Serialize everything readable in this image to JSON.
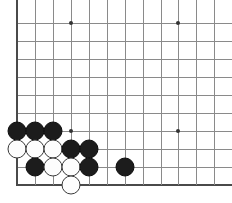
{
  "board": {
    "title": "Go board corner diagram",
    "description": "Bottom-left corner of a Go board showing a joseki-style stone formation",
    "line_color": "#8a8a8a",
    "edge_color": "#4a4a4a",
    "background_color": "#ffffff",
    "black_stone_color": "#1c1c1c",
    "white_stone_color": "#fdfdfd",
    "stone_diameter": 19,
    "grid_spacing": 17.9,
    "vertical_lines_x": [
      17,
      35,
      53,
      71,
      89,
      107,
      125,
      143,
      161,
      178,
      196,
      214
    ],
    "horizontal_lines_y": [
      23,
      41,
      59,
      77,
      95,
      113,
      131,
      149,
      167,
      185
    ],
    "edges": {
      "left_x": 17,
      "bottom_y": 185
    },
    "star_points": [
      {
        "name": "hoshi-top-left",
        "x": 71,
        "y": 23
      },
      {
        "name": "hoshi-top-right",
        "x": 178,
        "y": 23
      },
      {
        "name": "hoshi-bottom-left",
        "x": 71,
        "y": 131
      },
      {
        "name": "hoshi-bottom-right",
        "x": 178,
        "y": 131
      }
    ],
    "stones": [
      {
        "color": "black",
        "x": 17,
        "y": 131,
        "label": "black-stone-a1"
      },
      {
        "color": "black",
        "x": 35,
        "y": 131,
        "label": "black-stone-a2"
      },
      {
        "color": "black",
        "x": 53,
        "y": 131,
        "label": "black-stone-a3"
      },
      {
        "color": "white",
        "x": 17,
        "y": 149,
        "label": "white-stone-b1"
      },
      {
        "color": "white",
        "x": 35,
        "y": 149,
        "label": "white-stone-b2"
      },
      {
        "color": "white",
        "x": 53,
        "y": 149,
        "label": "white-stone-b3"
      },
      {
        "color": "black",
        "x": 71,
        "y": 149,
        "label": "black-stone-b4"
      },
      {
        "color": "black",
        "x": 89,
        "y": 149,
        "label": "black-stone-b5"
      },
      {
        "color": "black",
        "x": 35,
        "y": 167,
        "label": "black-stone-c2"
      },
      {
        "color": "white",
        "x": 53,
        "y": 167,
        "label": "white-stone-c3"
      },
      {
        "color": "white",
        "x": 71,
        "y": 167,
        "label": "white-stone-c4"
      },
      {
        "color": "black",
        "x": 89,
        "y": 167,
        "label": "black-stone-c5"
      },
      {
        "color": "black",
        "x": 125,
        "y": 167,
        "label": "black-stone-c7"
      },
      {
        "color": "white",
        "x": 71,
        "y": 185,
        "label": "white-stone-d4"
      }
    ],
    "counts": {
      "black": 9,
      "white": 6,
      "total": 15
    }
  }
}
